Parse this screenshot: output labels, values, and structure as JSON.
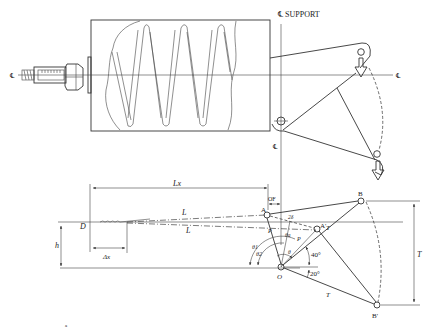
{
  "diagram": {
    "type": "engineering-schematic",
    "labels": {
      "support_centerline": "℄ SUPPORT",
      "centerline_left": "℄",
      "centerline_right": "℄",
      "centerline_pivot": "℄",
      "L_x": "Lx",
      "OF": "OF",
      "L_upper": "L",
      "L_lower": "L",
      "D": "D",
      "h": "h",
      "delta_x": "Δx",
      "A": "A",
      "A_prime": "A'",
      "B": "B",
      "B_prime": "B'",
      "O": "O",
      "P_left": "P",
      "P_right": "P",
      "T_upper": "T",
      "T_lower": "T",
      "T_right": "T",
      "theta_1": "θ1",
      "theta_2": "θ2",
      "theta": "θ",
      "theta_a": "θa",
      "theta_beta": "θβ",
      "two_delta": "2δ",
      "angle_40": "40°",
      "angle_20": "20°",
      "footnote_mark": "a"
    }
  }
}
